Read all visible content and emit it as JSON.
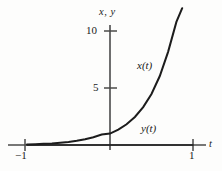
{
  "chart_data": {
    "type": "line",
    "title": "",
    "xlabel": "t",
    "ylabel": "x, y",
    "xlim": [
      -1,
      1
    ],
    "ylim": [
      0,
      11.5
    ],
    "grid": false,
    "legend": "inline-curve-labels",
    "x_ticks": [
      {
        "value": -1,
        "label": "−1"
      },
      {
        "value": 1,
        "label": "1"
      }
    ],
    "y_ticks": [
      {
        "value": 5,
        "label": "5"
      },
      {
        "value": 10,
        "label": "10"
      }
    ],
    "series": [
      {
        "name": "x(t)",
        "label": "x(t)",
        "color": "#1c1c1c",
        "x": [
          -1,
          -0.9,
          -0.8,
          -0.7,
          -0.6,
          -0.5,
          -0.4,
          -0.3,
          -0.2,
          -0.1,
          0,
          0.1,
          0.2,
          0.3,
          0.4,
          0.5,
          0.6,
          0.7,
          0.8,
          0.87
        ],
        "values": [
          0.05,
          0.07,
          0.1,
          0.14,
          0.2,
          0.27,
          0.37,
          0.5,
          0.68,
          0.92,
          1.0,
          1.35,
          1.82,
          2.46,
          3.32,
          4.48,
          6.05,
          8.17,
          10.8,
          12.0
        ]
      },
      {
        "name": "y(t)",
        "label": "y(t)",
        "color": "#1c1c1c",
        "x": [
          -1,
          1
        ],
        "values": [
          0,
          0
        ]
      }
    ]
  },
  "labels": {
    "axis_vertical": "x, y",
    "axis_horizontal": "t",
    "tick_10": "10",
    "tick_5": "5",
    "tick_neg_one": "−1",
    "tick_pos_one": "1",
    "curve_x": "x(t)",
    "curve_y": "y(t)"
  },
  "colors": {
    "background": "#fdfdfc",
    "axis": "#4a4a4a",
    "curve": "#1c1c1c",
    "text": "#1a1a1a"
  }
}
